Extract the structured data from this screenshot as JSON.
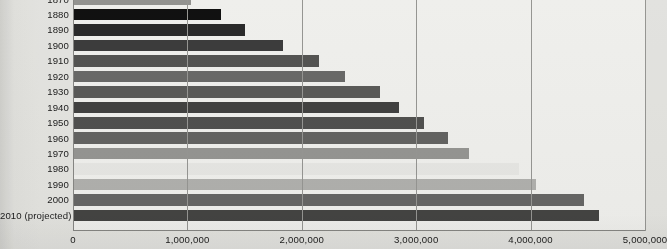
{
  "chart_data": {
    "type": "bar",
    "orientation": "horizontal",
    "title": "",
    "subtitle": "",
    "xlabel": "",
    "ylabel": "",
    "xlim": [
      0,
      5000000
    ],
    "ylim": null,
    "grid": true,
    "legend": false,
    "legend_position": "none",
    "xticks": [
      "0",
      "1,000,000",
      "2,000,000",
      "3,000,000",
      "4,000,000",
      "5,000,000"
    ],
    "xtick_values": [
      0,
      1000000,
      2000000,
      3000000,
      4000000,
      5000000
    ],
    "categories": [
      "1870",
      "1880",
      "1890",
      "1900",
      "1910",
      "1920",
      "1930",
      "1940",
      "1950",
      "1960",
      "1970",
      "1980",
      "1990",
      "2000",
      "2010 (projected)"
    ],
    "values": [
      1030000,
      1290000,
      1500000,
      1840000,
      2150000,
      2380000,
      2680000,
      2850000,
      3070000,
      3280000,
      3460000,
      3900000,
      4050000,
      4470000,
      4600000
    ],
    "bar_colors": [
      "#9a9a98",
      "#111111",
      "#2c2c2c",
      "#3f3f3f",
      "#585857",
      "#6e6e6d",
      "#5e5e5d",
      "#454544",
      "#545453",
      "#686867",
      "#9c9c9a",
      "#f2f2f0",
      "#b9b9b7",
      "#6b6b6a",
      "#474746"
    ]
  },
  "axes": {
    "x_axis_name": "population-axis",
    "y_axis_name": "decade-axis"
  }
}
